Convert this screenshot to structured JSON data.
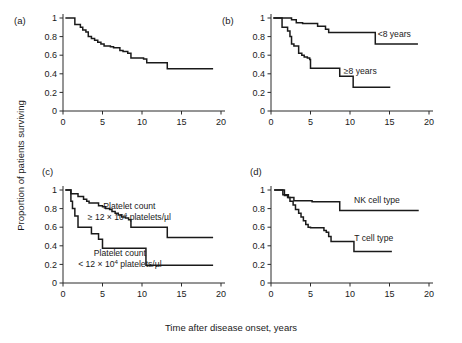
{
  "figure": {
    "ylabel": "Proportion of patients surviving",
    "xlabel": "Time after disease onset, years"
  },
  "chart_data": [
    {
      "type": "line",
      "panel": "(a)",
      "title": "",
      "xlabel": "Time after disease onset, years",
      "ylabel": "Proportion of patients surviving",
      "xlim": [
        0,
        20
      ],
      "ylim": [
        0,
        1
      ],
      "xticks": [
        0,
        5,
        10,
        15,
        20
      ],
      "yticks": [
        0,
        0.2,
        0.4,
        0.6,
        0.8,
        1
      ],
      "ytick_labels": [
        "0",
        "0.2",
        "0.4",
        "0.6",
        "0.8",
        "1"
      ],
      "grid": false,
      "legend": "none",
      "series": [
        {
          "name": "All patients",
          "x": [
            0.3,
            1.2,
            1.5,
            2.2,
            2.5,
            2.9,
            3.2,
            3.6,
            4.0,
            4.4,
            4.8,
            5.2,
            5.5,
            6.0,
            6.4,
            6.8,
            7.2,
            7.6,
            8.2,
            8.6,
            9.2,
            10.2,
            10.6,
            13.0,
            13.2,
            19.0
          ],
          "y": [
            1.0,
            1.0,
            0.93,
            0.9,
            0.87,
            0.85,
            0.8,
            0.78,
            0.76,
            0.74,
            0.72,
            0.7,
            0.7,
            0.69,
            0.68,
            0.68,
            0.65,
            0.64,
            0.62,
            0.57,
            0.57,
            0.56,
            0.52,
            0.52,
            0.455,
            0.455
          ]
        }
      ]
    },
    {
      "type": "line",
      "panel": "(b)",
      "title": "",
      "xlabel": "Time after disease onset, years",
      "ylabel": "Proportion of patients surviving",
      "xlim": [
        0,
        20
      ],
      "ylim": [
        0,
        1
      ],
      "xticks": [
        0,
        5,
        10,
        15,
        20
      ],
      "yticks": [
        0,
        0.2,
        0.4,
        0.6,
        0.8,
        1
      ],
      "ytick_labels": [
        "0",
        "0.2",
        "0.4",
        "0.6",
        "0.8",
        "1"
      ],
      "grid": false,
      "legend": "inline-labels",
      "series": [
        {
          "name": "<8 years",
          "label": "<8 years",
          "label_x": 15.6,
          "label_y": 0.8,
          "x": [
            0.3,
            2.4,
            2.6,
            3.0,
            3.2,
            3.7,
            4.0,
            5.6,
            5.9,
            6.6,
            6.9,
            7.3,
            12.9,
            13.2,
            18.6
          ],
          "y": [
            1.0,
            1.0,
            0.98,
            0.98,
            0.95,
            0.95,
            0.94,
            0.94,
            0.91,
            0.91,
            0.88,
            0.845,
            0.845,
            0.72,
            0.72
          ]
        },
        {
          "name": "≥8 years",
          "label": "≥8 years",
          "label_x": 11.3,
          "label_y": 0.395,
          "x": [
            0.3,
            1.1,
            1.4,
            2.1,
            2.4,
            2.6,
            2.9,
            3.2,
            3.5,
            3.9,
            4.2,
            4.6,
            4.9,
            5.0,
            8.4,
            8.7,
            10.1,
            10.4,
            15.1
          ],
          "y": [
            1.0,
            1.0,
            0.9,
            0.86,
            0.8,
            0.72,
            0.7,
            0.7,
            0.62,
            0.6,
            0.58,
            0.57,
            0.555,
            0.46,
            0.46,
            0.375,
            0.375,
            0.255,
            0.255
          ]
        }
      ]
    },
    {
      "type": "line",
      "panel": "(c)",
      "title": "",
      "xlabel": "Time after disease onset, years",
      "ylabel": "Proportion of patients surviving",
      "xlim": [
        0,
        20
      ],
      "ylim": [
        0,
        1
      ],
      "xticks": [
        0,
        5,
        10,
        15,
        20
      ],
      "yticks": [
        0,
        0.2,
        0.4,
        0.6,
        0.8,
        1
      ],
      "ytick_labels": [
        "0",
        "0.2",
        "0.4",
        "0.6",
        "0.8",
        "1"
      ],
      "grid": false,
      "legend": "inline-labels",
      "series": [
        {
          "name": "Platelet count >= 12e4 platelets/ul",
          "label_line1": "Platelet count",
          "label_line2_pre": "≥ 12 × 10",
          "label_line2_sup": "4",
          "label_line2_post": " platelets/µl",
          "label_x": 8.4,
          "label_y1": 0.8,
          "label_y2": 0.68,
          "x": [
            0.3,
            0.8,
            1.0,
            1.6,
            1.9,
            2.3,
            2.6,
            3.0,
            3.3,
            4.2,
            4.5,
            5.0,
            5.4,
            5.9,
            6.2,
            6.6,
            7.0,
            7.4,
            7.9,
            8.3,
            8.6,
            12.9,
            13.2,
            19.0
          ],
          "y": [
            1.0,
            1.0,
            0.96,
            0.96,
            0.93,
            0.93,
            0.9,
            0.88,
            0.86,
            0.86,
            0.83,
            0.82,
            0.8,
            0.79,
            0.77,
            0.75,
            0.73,
            0.71,
            0.7,
            0.68,
            0.6,
            0.6,
            0.49,
            0.49
          ]
        },
        {
          "name": "Platelet count < 12e4 platelets/ul",
          "label_line1": "Platelet count",
          "label_line2_pre": "< 12 × 10",
          "label_line2_sup": "4",
          "label_line2_post": " platelets/µl",
          "label_x": 7.2,
          "label_y1": 0.29,
          "label_y2": 0.17,
          "x": [
            0.3,
            0.7,
            1.0,
            1.2,
            1.5,
            1.9,
            3.3,
            3.6,
            4.2,
            4.5,
            4.8,
            5.0,
            10.2,
            10.5,
            19.0
          ],
          "y": [
            1.0,
            1.0,
            0.88,
            0.8,
            0.72,
            0.6,
            0.6,
            0.53,
            0.53,
            0.47,
            0.47,
            0.375,
            0.375,
            0.19,
            0.19
          ]
        }
      ]
    },
    {
      "type": "line",
      "panel": "(d)",
      "title": "",
      "xlabel": "Time after disease onset, years",
      "ylabel": "Proportion of patients surviving",
      "xlim": [
        0,
        20
      ],
      "ylim": [
        0,
        1
      ],
      "xticks": [
        0,
        5,
        10,
        15,
        20
      ],
      "yticks": [
        0,
        0.2,
        0.4,
        0.6,
        0.8,
        1
      ],
      "ytick_labels": [
        "0",
        "0.2",
        "0.4",
        "0.6",
        "0.8",
        "1"
      ],
      "grid": false,
      "legend": "inline-labels",
      "series": [
        {
          "name": "NK cell type",
          "label": "NK cell type",
          "label_x": 13.4,
          "label_y": 0.86,
          "x": [
            0.4,
            1.2,
            1.5,
            1.9,
            2.2,
            2.6,
            2.9,
            4.9,
            5.2,
            8.4,
            8.7,
            18.7
          ],
          "y": [
            1.0,
            1.0,
            0.95,
            0.95,
            0.92,
            0.92,
            0.885,
            0.885,
            0.875,
            0.875,
            0.78,
            0.78
          ]
        },
        {
          "name": "T cell type",
          "label": "T cell type",
          "label_x": 13.0,
          "label_y": 0.455,
          "x": [
            0.4,
            1.4,
            1.7,
            2.1,
            2.4,
            2.8,
            3.1,
            3.5,
            3.8,
            4.1,
            4.4,
            4.7,
            5.0,
            6.4,
            6.7,
            7.0,
            7.3,
            7.6,
            10.2,
            10.5,
            15.3
          ],
          "y": [
            1.0,
            1.0,
            0.94,
            0.92,
            0.88,
            0.84,
            0.79,
            0.75,
            0.71,
            0.67,
            0.63,
            0.6,
            0.595,
            0.595,
            0.565,
            0.545,
            0.5,
            0.445,
            0.445,
            0.34,
            0.34
          ]
        }
      ]
    }
  ]
}
